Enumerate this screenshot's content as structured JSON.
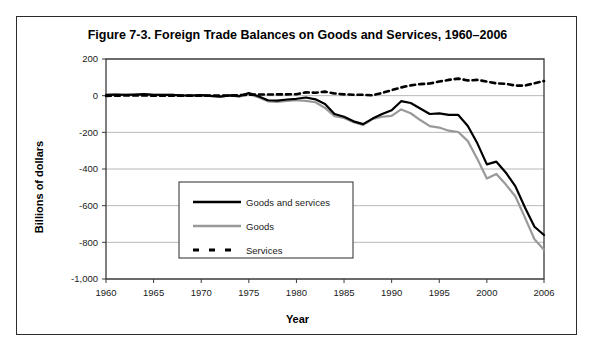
{
  "figure": {
    "title": "Figure 7-3. Foreign Trade Balances on Goods and Services, 1960–2006"
  },
  "axes": {
    "x_title": "Year",
    "y_title": "Billions of dollars",
    "x_tick_labels": [
      "1960",
      "1965",
      "1970",
      "1975",
      "1980",
      "1985",
      "1990",
      "1995",
      "2000",
      "2006"
    ],
    "y_tick_labels": [
      "200",
      "0",
      "-200",
      "-400",
      "-600",
      "-800",
      "-1,000"
    ]
  },
  "legend": {
    "items": [
      {
        "label": "Goods and services",
        "color": "#000000",
        "style": "solid"
      },
      {
        "label": "Goods",
        "color": "#999999",
        "style": "solid"
      },
      {
        "label": "Services",
        "color": "#000000",
        "style": "dashed"
      }
    ]
  },
  "chart_data": {
    "type": "line",
    "title": "Figure 7-3. Foreign Trade Balances on Goods and Services, 1960–2006",
    "xlabel": "Year",
    "ylabel": "Billions of dollars",
    "xlim": [
      1960,
      2006
    ],
    "ylim": [
      -1000,
      200
    ],
    "ytick_interval": 200,
    "xtick_interval": 5,
    "grid": true,
    "legend_position": "center-left-inside",
    "x": [
      1960,
      1961,
      1962,
      1963,
      1964,
      1965,
      1966,
      1967,
      1968,
      1969,
      1970,
      1971,
      1972,
      1973,
      1974,
      1975,
      1976,
      1977,
      1978,
      1979,
      1980,
      1981,
      1982,
      1983,
      1984,
      1985,
      1986,
      1987,
      1988,
      1989,
      1990,
      1991,
      1992,
      1993,
      1994,
      1995,
      1996,
      1997,
      1998,
      1999,
      2000,
      2001,
      2002,
      2003,
      2004,
      2005,
      2006
    ],
    "series": [
      {
        "name": "Goods and services",
        "color": "#000000",
        "style": "solid",
        "values": [
          4,
          6,
          5,
          6,
          8,
          5,
          4,
          4,
          1,
          1,
          3,
          -1,
          -5,
          2,
          -2,
          14,
          -3,
          -25,
          -27,
          -21,
          -17,
          -10,
          -20,
          -45,
          -100,
          -115,
          -140,
          -155,
          -125,
          -100,
          -80,
          -30,
          -40,
          -70,
          -100,
          -97,
          -105,
          -105,
          -165,
          -260,
          -375,
          -360,
          -420,
          -495,
          -610,
          -715,
          -760
        ]
      },
      {
        "name": "Goods",
        "color": "#999999",
        "style": "solid",
        "values": [
          5,
          6,
          4,
          5,
          7,
          5,
          4,
          4,
          1,
          1,
          3,
          -2,
          -6,
          1,
          -5,
          9,
          -9,
          -31,
          -34,
          -28,
          -25,
          -28,
          -36,
          -67,
          -112,
          -122,
          -145,
          -160,
          -127,
          -115,
          -110,
          -75,
          -96,
          -133,
          -166,
          -174,
          -191,
          -198,
          -248,
          -346,
          -452,
          -427,
          -485,
          -550,
          -665,
          -783,
          -840
        ]
      },
      {
        "name": "Services",
        "color": "#000000",
        "style": "dashed",
        "values": [
          -1,
          0,
          1,
          1,
          1,
          0,
          0,
          0,
          0,
          0,
          0,
          1,
          1,
          1,
          3,
          5,
          6,
          6,
          7,
          7,
          8,
          18,
          16,
          22,
          12,
          7,
          5,
          5,
          2,
          15,
          30,
          45,
          56,
          63,
          66,
          77,
          86,
          93,
          83,
          86,
          77,
          67,
          65,
          55,
          55,
          68,
          80
        ]
      }
    ]
  }
}
